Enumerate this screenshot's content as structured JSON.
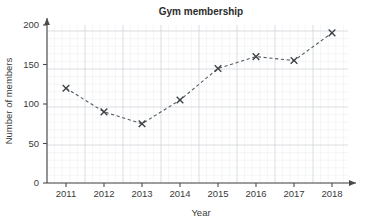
{
  "chart_data": {
    "type": "line",
    "title": "Gym membership",
    "xlabel": "Year",
    "ylabel": "Number of members",
    "categories": [
      "2011",
      "2012",
      "2013",
      "2014",
      "2015",
      "2016",
      "2017",
      "2018"
    ],
    "x": [
      2011,
      2012,
      2013,
      2014,
      2015,
      2016,
      2017,
      2018
    ],
    "values": [
      120,
      90,
      75,
      105,
      145,
      160,
      155,
      190
    ],
    "series": [
      {
        "name": "Number of members",
        "values": [
          120,
          90,
          75,
          105,
          145,
          160,
          155,
          190
        ]
      }
    ],
    "ylim": [
      0,
      200
    ],
    "xlim": [
      2010.5,
      2018.5
    ],
    "yticks": [
      0,
      50,
      100,
      150,
      200
    ],
    "ytick_labels": [
      "0",
      "50",
      "100",
      "150",
      "200"
    ],
    "xtick_labels": [
      "2011",
      "2012",
      "2013",
      "2014",
      "2015",
      "2016",
      "2017",
      "2018"
    ],
    "grid": true,
    "grid_minor": true,
    "legend": false,
    "legend_position": "none",
    "marker": "x",
    "linestyle": "dashed",
    "line_color": "#555b60",
    "marker_color": "#3c4145",
    "grid_minor_color": "#e9ecef",
    "grid_major_color": "#ced2d6",
    "axis_color": "#4a4a4a",
    "background_color": "#ffffff"
  }
}
